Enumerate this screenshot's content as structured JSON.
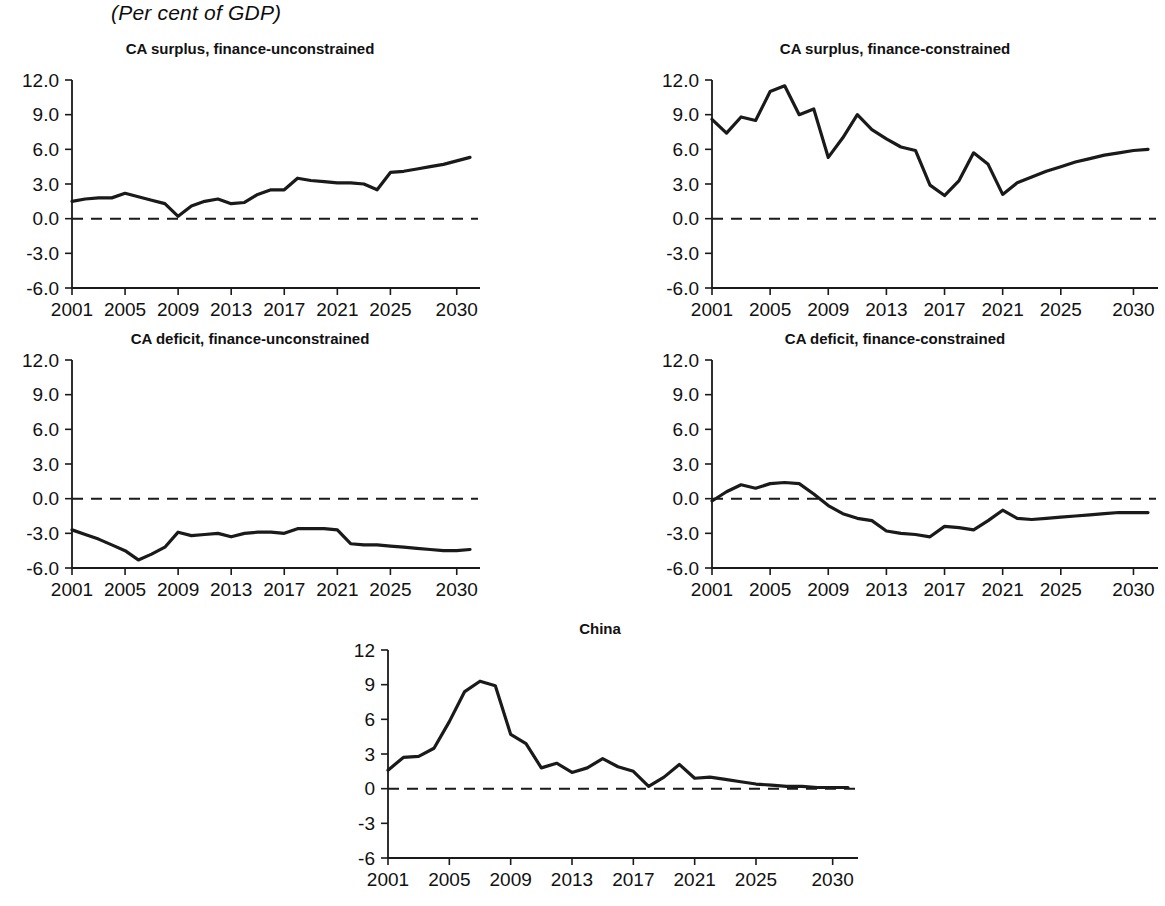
{
  "page": {
    "subtitle": "(Per cent of GDP)"
  },
  "chart_data": [
    {
      "id": "ca-surplus-finance-unconstrained",
      "type": "line",
      "title": "CA surplus, finance-unconstrained",
      "xlabel": "",
      "ylabel": "",
      "ylim": [
        -6.0,
        12.0
      ],
      "xlim": [
        2001,
        2031
      ],
      "grid": false,
      "legend": "none",
      "ytick_labels": [
        "12.0",
        "9.0",
        "6.0",
        "3.0",
        "0.0",
        "-3.0",
        "-6.0"
      ],
      "yticks": [
        12.0,
        9.0,
        6.0,
        3.0,
        0.0,
        -3.0,
        -6.0
      ],
      "xtick_labels": [
        "2001",
        "2005",
        "2009",
        "2013",
        "2017",
        "2021",
        "2025",
        "2030"
      ],
      "xticks": [
        2001,
        2005,
        2009,
        2013,
        2017,
        2021,
        2025,
        2030
      ],
      "zero_reference_line": 0.0,
      "x": [
        2001,
        2002,
        2003,
        2004,
        2005,
        2006,
        2007,
        2008,
        2009,
        2010,
        2011,
        2012,
        2013,
        2014,
        2015,
        2016,
        2017,
        2018,
        2019,
        2020,
        2021,
        2022,
        2023,
        2024,
        2025,
        2026,
        2027,
        2028,
        2029,
        2030,
        2031
      ],
      "values": [
        1.5,
        1.7,
        1.8,
        1.8,
        2.2,
        1.9,
        1.6,
        1.3,
        0.2,
        1.1,
        1.5,
        1.7,
        1.3,
        1.4,
        2.1,
        2.5,
        2.5,
        3.5,
        3.3,
        3.2,
        3.1,
        3.1,
        3.0,
        2.5,
        4.0,
        4.1,
        4.3,
        4.5,
        4.7,
        5.0,
        5.3
      ]
    },
    {
      "id": "ca-surplus-finance-constrained",
      "type": "line",
      "title": "CA surplus, finance-constrained",
      "xlabel": "",
      "ylabel": "",
      "ylim": [
        -6.0,
        12.0
      ],
      "xlim": [
        2001,
        2031
      ],
      "grid": false,
      "legend": "none",
      "ytick_labels": [
        "12.0",
        "9.0",
        "6.0",
        "3.0",
        "0.0",
        "-3.0",
        "-6.0"
      ],
      "yticks": [
        12.0,
        9.0,
        6.0,
        3.0,
        0.0,
        -3.0,
        -6.0
      ],
      "xtick_labels": [
        "2001",
        "2005",
        "2009",
        "2013",
        "2017",
        "2021",
        "2025",
        "2030"
      ],
      "xticks": [
        2001,
        2005,
        2009,
        2013,
        2017,
        2021,
        2025,
        2030
      ],
      "zero_reference_line": 0.0,
      "x": [
        2001,
        2002,
        2003,
        2004,
        2005,
        2006,
        2007,
        2008,
        2009,
        2010,
        2011,
        2012,
        2013,
        2014,
        2015,
        2016,
        2017,
        2018,
        2019,
        2020,
        2021,
        2022,
        2023,
        2024,
        2025,
        2026,
        2027,
        2028,
        2029,
        2030,
        2031
      ],
      "values": [
        8.6,
        7.4,
        8.8,
        8.5,
        11.0,
        11.5,
        9.0,
        9.5,
        5.3,
        7.0,
        9.0,
        7.7,
        6.9,
        6.2,
        5.9,
        2.9,
        2.0,
        3.3,
        5.7,
        4.7,
        2.1,
        3.1,
        3.6,
        4.1,
        4.5,
        4.9,
        5.2,
        5.5,
        5.7,
        5.9,
        6.0
      ]
    },
    {
      "id": "ca-deficit-finance-unconstrained",
      "type": "line",
      "title": "CA deficit, finance-unconstrained",
      "xlabel": "",
      "ylabel": "",
      "ylim": [
        -6.0,
        12.0
      ],
      "xlim": [
        2001,
        2031
      ],
      "grid": false,
      "legend": "none",
      "ytick_labels": [
        "12.0",
        "9.0",
        "6.0",
        "3.0",
        "0.0",
        "-3.0",
        "-6.0"
      ],
      "yticks": [
        12.0,
        9.0,
        6.0,
        3.0,
        0.0,
        -3.0,
        -6.0
      ],
      "xtick_labels": [
        "2001",
        "2005",
        "2009",
        "2013",
        "2017",
        "2021",
        "2025",
        "2030"
      ],
      "xticks": [
        2001,
        2005,
        2009,
        2013,
        2017,
        2021,
        2025,
        2030
      ],
      "zero_reference_line": 0.0,
      "x": [
        2001,
        2002,
        2003,
        2004,
        2005,
        2006,
        2007,
        2008,
        2009,
        2010,
        2011,
        2012,
        2013,
        2014,
        2015,
        2016,
        2017,
        2018,
        2019,
        2020,
        2021,
        2022,
        2023,
        2024,
        2025,
        2026,
        2027,
        2028,
        2029,
        2030,
        2031
      ],
      "values": [
        -2.7,
        -3.1,
        -3.5,
        -4.0,
        -4.5,
        -5.3,
        -4.8,
        -4.2,
        -2.9,
        -3.2,
        -3.1,
        -3.0,
        -3.3,
        -3.0,
        -2.9,
        -2.9,
        -3.0,
        -2.6,
        -2.6,
        -2.6,
        -2.7,
        -3.9,
        -4.0,
        -4.0,
        -4.1,
        -4.2,
        -4.3,
        -4.4,
        -4.5,
        -4.5,
        -4.4
      ]
    },
    {
      "id": "ca-deficit-finance-constrained",
      "type": "line",
      "title": "CA deficit, finance-constrained",
      "xlabel": "",
      "ylabel": "",
      "ylim": [
        -6.0,
        12.0
      ],
      "xlim": [
        2001,
        2031
      ],
      "grid": false,
      "legend": "none",
      "ytick_labels": [
        "12.0",
        "9.0",
        "6.0",
        "3.0",
        "0.0",
        "-3.0",
        "-6.0"
      ],
      "yticks": [
        12.0,
        9.0,
        6.0,
        3.0,
        0.0,
        -3.0,
        -6.0
      ],
      "xtick_labels": [
        "2001",
        "2005",
        "2009",
        "2013",
        "2017",
        "2021",
        "2025",
        "2030"
      ],
      "xticks": [
        2001,
        2005,
        2009,
        2013,
        2017,
        2021,
        2025,
        2030
      ],
      "zero_reference_line": 0.0,
      "x": [
        2001,
        2002,
        2003,
        2004,
        2005,
        2006,
        2007,
        2008,
        2009,
        2010,
        2011,
        2012,
        2013,
        2014,
        2015,
        2016,
        2017,
        2018,
        2019,
        2020,
        2021,
        2022,
        2023,
        2024,
        2025,
        2026,
        2027,
        2028,
        2029,
        2030,
        2031
      ],
      "values": [
        -0.2,
        0.6,
        1.2,
        0.9,
        1.3,
        1.4,
        1.3,
        0.4,
        -0.6,
        -1.3,
        -1.7,
        -1.9,
        -2.8,
        -3.0,
        -3.1,
        -3.3,
        -2.4,
        -2.5,
        -2.7,
        -1.9,
        -1.0,
        -1.7,
        -1.8,
        -1.7,
        -1.6,
        -1.5,
        -1.4,
        -1.3,
        -1.2,
        -1.2,
        -1.2
      ]
    },
    {
      "id": "china",
      "type": "line",
      "title": "China",
      "xlabel": "",
      "ylabel": "",
      "ylim": [
        -6,
        12
      ],
      "xlim": [
        2001,
        2031
      ],
      "grid": false,
      "legend": "none",
      "ytick_labels": [
        "12",
        "9",
        "6",
        "3",
        "0",
        "-3",
        "-6"
      ],
      "yticks": [
        12,
        9,
        6,
        3,
        0,
        -3,
        -6
      ],
      "xtick_labels": [
        "2001",
        "2005",
        "2009",
        "2013",
        "2017",
        "2021",
        "2025",
        "2030"
      ],
      "xticks": [
        2001,
        2005,
        2009,
        2013,
        2017,
        2021,
        2025,
        2030
      ],
      "zero_reference_line": 0,
      "x": [
        2001,
        2002,
        2003,
        2004,
        2005,
        2006,
        2007,
        2008,
        2009,
        2010,
        2011,
        2012,
        2013,
        2014,
        2015,
        2016,
        2017,
        2018,
        2019,
        2020,
        2021,
        2022,
        2023,
        2024,
        2025,
        2026,
        2027,
        2028,
        2029,
        2030,
        2031
      ],
      "values": [
        1.6,
        2.7,
        2.8,
        3.5,
        5.8,
        8.4,
        9.3,
        8.9,
        4.7,
        3.9,
        1.8,
        2.2,
        1.4,
        1.8,
        2.6,
        1.9,
        1.5,
        0.2,
        1.0,
        2.1,
        0.9,
        1.0,
        0.8,
        0.6,
        0.4,
        0.3,
        0.2,
        0.2,
        0.1,
        0.1,
        0.1
      ]
    }
  ]
}
